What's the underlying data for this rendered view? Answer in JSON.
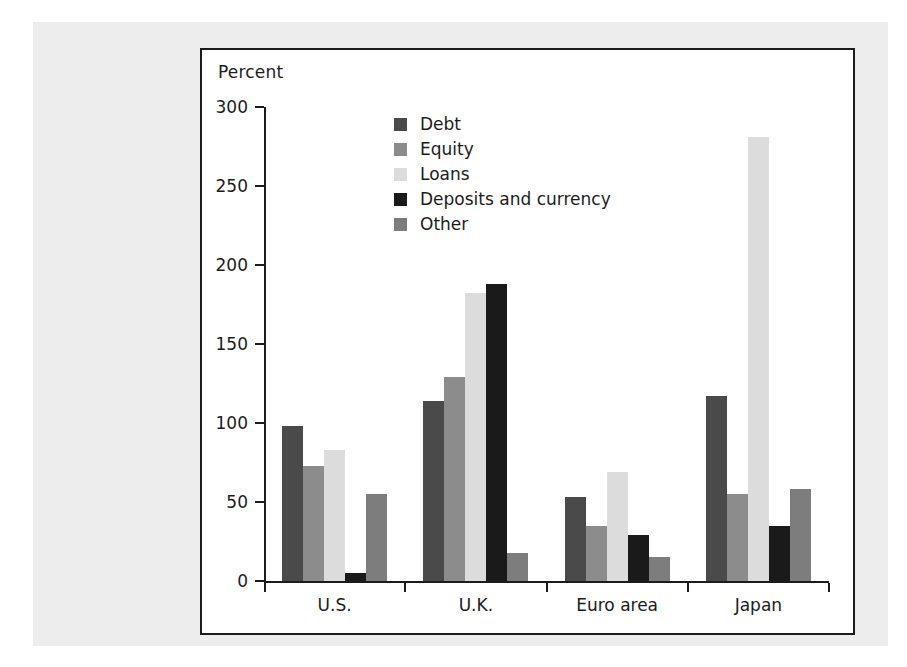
{
  "chart_data": {
    "type": "bar",
    "title": "",
    "subtitle": "",
    "xlabel": "",
    "ylabel": "Percent",
    "ylim": [
      0,
      300
    ],
    "ytick_labels": [
      "0",
      "50",
      "100",
      "150",
      "200",
      "250",
      "300"
    ],
    "yticks": [
      0,
      50,
      100,
      150,
      200,
      250,
      300
    ],
    "grid": false,
    "legend_position": "upper-center",
    "categories": [
      "U.S.",
      "U.K.",
      "Euro area",
      "Japan"
    ],
    "series": [
      {
        "name": "Debt",
        "color": "#4a4a4a",
        "values": [
          98,
          114,
          53,
          117
        ]
      },
      {
        "name": "Equity",
        "color": "#8c8c8c",
        "values": [
          73,
          129,
          35,
          55
        ]
      },
      {
        "name": "Loans",
        "color": "#dcdcdc",
        "values": [
          83,
          182,
          69,
          281
        ]
      },
      {
        "name": "Deposits and currency",
        "color": "#1a1a1a",
        "values": [
          5,
          188,
          29,
          35
        ]
      },
      {
        "name": "Other",
        "color": "#7d7d7d",
        "values": [
          55,
          18,
          15,
          58
        ]
      }
    ]
  },
  "panel": {
    "axis_title": "Percent"
  }
}
